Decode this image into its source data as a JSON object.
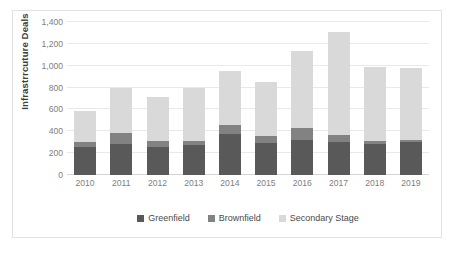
{
  "chart_data": {
    "type": "bar",
    "stacked": true,
    "title": "",
    "xlabel": "",
    "ylabel": "Infrastrrcuture Deals",
    "ylim": [
      0,
      1400
    ],
    "ytick_step": 200,
    "ytick_labels": [
      "0",
      "200",
      "400",
      "600",
      "800",
      "1,000",
      "1,200",
      "1,400"
    ],
    "ytick_values": [
      0,
      200,
      400,
      600,
      800,
      1000,
      1200,
      1400
    ],
    "grid": true,
    "legend_position": "bottom",
    "categories": [
      "2010",
      "2011",
      "2012",
      "2013",
      "2014",
      "2015",
      "2016",
      "2017",
      "2018",
      "2019"
    ],
    "series": [
      {
        "name": "Greenfield",
        "color": "#595959",
        "values": [
          255,
          280,
          260,
          272,
          372,
          290,
          322,
          300,
          282,
          300
        ]
      },
      {
        "name": "Brownfield",
        "color": "#828282",
        "values": [
          43,
          100,
          48,
          40,
          82,
          70,
          110,
          63,
          30,
          22
        ]
      },
      {
        "name": "Secondary Stage",
        "color": "#d9d9d9",
        "values": [
          292,
          420,
          402,
          483,
          501,
          495,
          703,
          942,
          678,
          653
        ]
      }
    ],
    "totals": [
      590,
      800,
      710,
      795,
      955,
      855,
      1135,
      1305,
      990,
      975
    ]
  }
}
